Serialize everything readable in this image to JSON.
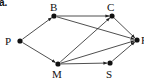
{
  "figure_label": "a.",
  "nodes": [
    {
      "id": "P",
      "label": "P",
      "x": 20,
      "y": 41,
      "lx": 5,
      "ly": 36
    },
    {
      "id": "B",
      "label": "B",
      "x": 54,
      "y": 16,
      "lx": 50,
      "ly": 2
    },
    {
      "id": "C",
      "label": "C",
      "x": 112,
      "y": 16,
      "lx": 107,
      "ly": 2
    },
    {
      "id": "F",
      "label": "F",
      "x": 137,
      "y": 40,
      "lx": 141,
      "ly": 35
    },
    {
      "id": "M",
      "label": "M",
      "x": 58,
      "y": 64,
      "lx": 52,
      "ly": 69
    },
    {
      "id": "S",
      "label": "S",
      "x": 110,
      "y": 63,
      "lx": 106,
      "ly": 69
    }
  ],
  "edges": [
    {
      "from": "P",
      "to": "B"
    },
    {
      "from": "P",
      "to": "M"
    },
    {
      "from": "B",
      "to": "C"
    },
    {
      "from": "B",
      "to": "F"
    },
    {
      "from": "C",
      "to": "F"
    },
    {
      "from": "M",
      "to": "C"
    },
    {
      "from": "M",
      "to": "F"
    },
    {
      "from": "M",
      "to": "S"
    },
    {
      "from": "S",
      "to": "F"
    }
  ],
  "colors": {
    "stroke": "#222222",
    "node": "#111111",
    "text": "#111111"
  }
}
